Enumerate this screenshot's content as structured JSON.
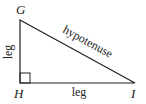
{
  "diagram": {
    "type": "right-triangle",
    "vertices": {
      "G": "G",
      "H": "H",
      "I": "I"
    },
    "sides": {
      "vertical_leg": "leg",
      "horizontal_leg": "leg",
      "hypotenuse": "hypotenuse"
    },
    "right_angle_at": "H",
    "stroke_color": "#222222"
  }
}
